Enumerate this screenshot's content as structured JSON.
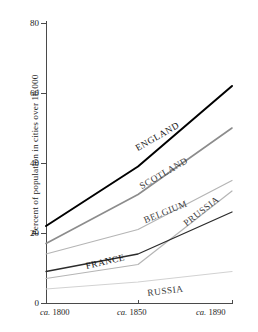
{
  "chart_data": {
    "type": "line",
    "title": "",
    "subtitle": "",
    "xlabel": "",
    "ylabel": "Percent of population in cities over 10,000",
    "x": [
      "ca. 1800",
      "ca. 1850",
      "ca. 1890"
    ],
    "categories": [
      "ca. 1800",
      "ca. 1850",
      "ca. 1890"
    ],
    "xtick_labels": [
      "ca. 1800",
      "ca. 1850",
      "ca. 1890"
    ],
    "ytick_labels": [
      "0",
      "20",
      "40",
      "60",
      "80"
    ],
    "ytick_values": [
      0,
      20,
      40,
      60,
      80
    ],
    "ylim": [
      0,
      80
    ],
    "grid": false,
    "legend": "inline-labels",
    "legend_position": "along-series",
    "series": [
      {
        "name": "ENGLAND",
        "values": [
          22,
          39,
          62
        ],
        "color": "#000000",
        "width": 2.0,
        "label_x": 139,
        "label_y": 144,
        "label_angle": -30
      },
      {
        "name": "SCOTLAND",
        "values": [
          17,
          31,
          50
        ],
        "color": "#8c8c8c",
        "width": 1.6,
        "label_x": 143,
        "label_y": 182,
        "label_angle": -30
      },
      {
        "name": "BELGIUM",
        "values": [
          14,
          21,
          35
        ],
        "color": "#b5b5b5",
        "width": 1.2,
        "label_x": 146,
        "label_y": 216,
        "label_angle": -22
      },
      {
        "name": "PRUSSIA",
        "values": [
          7,
          11,
          32
        ],
        "color": "#b5b5b5",
        "width": 1.2,
        "label_x": 188,
        "label_y": 219,
        "label_angle": -38
      },
      {
        "name": "FRANCE",
        "values": [
          9,
          14,
          26
        ],
        "color": "#2b2b2b",
        "width": 1.3,
        "label_x": 87,
        "label_y": 262,
        "label_angle": -13
      },
      {
        "name": "RUSSIA",
        "values": [
          4,
          6,
          9
        ],
        "color": "#d2d2d2",
        "width": 1.2,
        "label_x": 148,
        "label_y": 289,
        "label_angle": -7
      }
    ]
  },
  "axes": {
    "y_title": "Percent of population in cities over 10,000",
    "y_ticks": [
      {
        "label": "80",
        "value": 80
      },
      {
        "label": "60",
        "value": 60
      },
      {
        "label": "40",
        "value": 40
      },
      {
        "label": "20",
        "value": 20
      },
      {
        "label": "0",
        "value": 0
      }
    ],
    "x_ticks": [
      {
        "prefix": "ca.",
        "year": "1800"
      },
      {
        "prefix": "ca.",
        "year": "1850"
      },
      {
        "prefix": "ca.",
        "year": "1890"
      }
    ]
  },
  "colors": {
    "axis": "#4a4a4a",
    "text": "#1c1c1c",
    "background": "#ffffff"
  }
}
